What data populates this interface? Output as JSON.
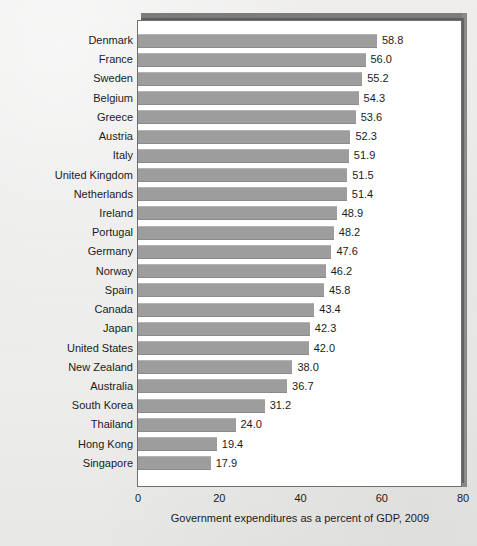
{
  "chart_data": {
    "type": "bar",
    "orientation": "horizontal",
    "title": "",
    "xlabel": "Government expenditures as a percent of GDP, 2009",
    "ylabel": "",
    "xlim": [
      0,
      80
    ],
    "xticks": [
      0,
      20,
      40,
      60,
      80
    ],
    "xtick_labels": [
      "0",
      "20",
      "40",
      "60",
      "80"
    ],
    "grid": false,
    "legend": null,
    "bar_color": "#9d9d9d",
    "value_label_format": "one-decimal",
    "categories": [
      "Denmark",
      "France",
      "Sweden",
      "Belgium",
      "Greece",
      "Austria",
      "Italy",
      "United Kingdom",
      "Netherlands",
      "Ireland",
      "Portugal",
      "Germany",
      "Norway",
      "Spain",
      "Canada",
      "Japan",
      "United States",
      "New Zealand",
      "Australia",
      "South Korea",
      "Thailand",
      "Hong Kong",
      "Singapore"
    ],
    "values": [
      58.8,
      56.0,
      55.2,
      54.3,
      53.6,
      52.3,
      51.9,
      51.5,
      51.4,
      48.9,
      48.2,
      47.6,
      46.2,
      45.8,
      43.4,
      42.3,
      42.0,
      38.0,
      36.7,
      31.2,
      24.0,
      19.4,
      17.9
    ],
    "value_labels": [
      "58.8",
      "56.0",
      "55.2",
      "54.3",
      "53.6",
      "52.3",
      "51.9",
      "51.5",
      "51.4",
      "48.9",
      "48.2",
      "47.6",
      "46.2",
      "45.8",
      "43.4",
      "42.3",
      "42.0",
      "38.0",
      "36.7",
      "31.2",
      "24.0",
      "19.4",
      "17.9"
    ]
  }
}
